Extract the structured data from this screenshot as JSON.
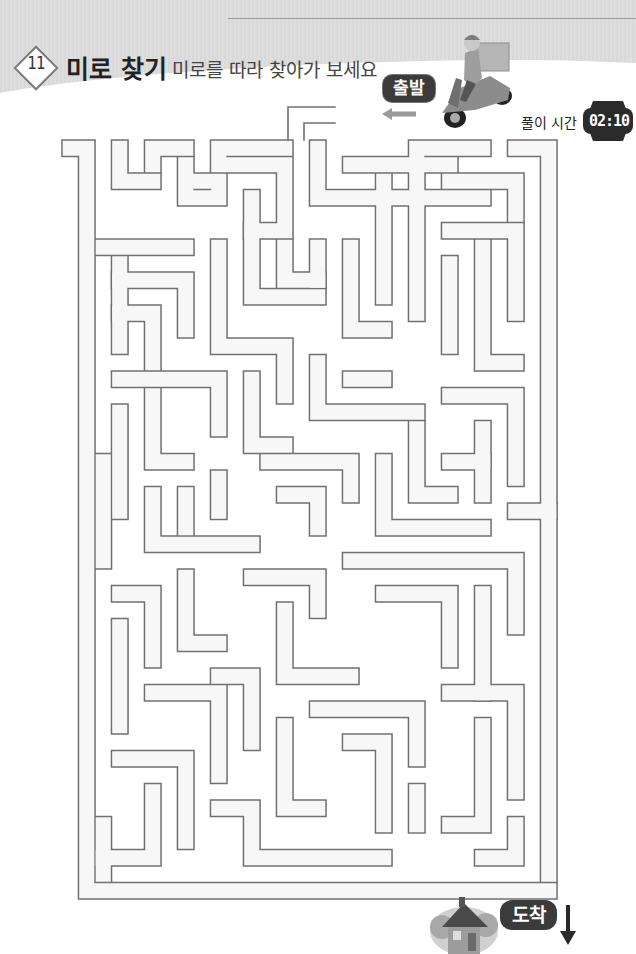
{
  "header": {
    "number": "11",
    "title": "미로 찾기",
    "subtitle": "미로를 따라 찾아가 보세요"
  },
  "start": {
    "label": "출발",
    "arrow": "left-arrow-icon"
  },
  "timer": {
    "label": "풀이 시간",
    "value": "02:10",
    "icon": "watch-icon"
  },
  "end": {
    "label": "도착",
    "arrow": "down-arrow-icon",
    "destination_icon": "house-icon"
  },
  "illustration": {
    "start_icon": "delivery-scooter-icon"
  },
  "colors": {
    "maze_line": "#707070",
    "maze_fill": "#f7f7f7",
    "badge_bg": "#3b3b3b",
    "arrow_start": "#9a9a9a",
    "arrow_end": "#2a2a2a"
  }
}
